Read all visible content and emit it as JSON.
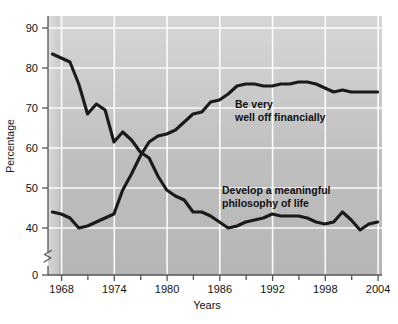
{
  "chart_data": {
    "type": "line",
    "title": "",
    "xlabel": "Years",
    "ylabel": "Percentage",
    "xlim": [
      1966.5,
      2004.5
    ],
    "ylim": [
      36,
      93
    ],
    "y_axis_break": true,
    "y_break_label": "0",
    "grid": true,
    "legend_position": "inline-annotations",
    "xticks": [
      1968,
      1974,
      1980,
      1986,
      1992,
      1998,
      2004
    ],
    "xtick_labels": [
      "1968",
      "1974",
      "1980",
      "1986",
      "1992",
      "1998",
      "2004"
    ],
    "xminorticks": [
      1971,
      1977,
      1983,
      1989,
      1995,
      2001
    ],
    "yticks": [
      0,
      40,
      50,
      60,
      70,
      80,
      90
    ],
    "ytick_labels": [
      "0",
      "40",
      "50",
      "60",
      "70",
      "80",
      "90"
    ],
    "x": [
      1967,
      1968,
      1969,
      1970,
      1971,
      1972,
      1973,
      1974,
      1975,
      1976,
      1977,
      1978,
      1979,
      1980,
      1981,
      1982,
      1983,
      1984,
      1985,
      1986,
      1987,
      1988,
      1989,
      1990,
      1991,
      1992,
      1993,
      1994,
      1995,
      1996,
      1997,
      1998,
      1999,
      2000,
      2001,
      2002,
      2003,
      2004
    ],
    "series": [
      {
        "name": "Be very well off financially",
        "color": "#1a1a1a",
        "label_line1": "Be very",
        "label_line2": "well off financially",
        "values": [
          44.0,
          43.5,
          42.5,
          40.0,
          40.5,
          41.5,
          42.5,
          43.5,
          49.5,
          53.5,
          58.0,
          61.5,
          63.0,
          63.5,
          64.5,
          66.5,
          68.5,
          69.0,
          71.5,
          72.0,
          73.5,
          75.5,
          76.0,
          76.0,
          75.5,
          75.5,
          76.0,
          76.0,
          76.5,
          76.5,
          76.0,
          75.0,
          74.0,
          74.5,
          74.0,
          74.0,
          74.0,
          74.0
        ]
      },
      {
        "name": "Develop a meaningful philosophy of life",
        "color": "#1a1a1a",
        "label_line1": "Develop a meaningful",
        "label_line2": "philosophy of life",
        "values": [
          83.5,
          82.5,
          81.5,
          76.0,
          68.5,
          71.0,
          69.5,
          61.5,
          64.0,
          62.0,
          59.0,
          57.5,
          53.0,
          49.5,
          48.0,
          47.0,
          44.0,
          44.0,
          43.0,
          41.5,
          40.0,
          40.5,
          41.5,
          42.0,
          42.5,
          43.5,
          43.0,
          43.0,
          43.0,
          42.5,
          41.5,
          41.0,
          41.5,
          44.0,
          42.0,
          39.5,
          41.0,
          41.5
        ]
      }
    ],
    "colors": {
      "plot_background_top": "#d2d2d2",
      "plot_background_bottom": "#b9b9b9",
      "gridline": "#ffffff",
      "axis": "#555555",
      "line": "#1a1a1a",
      "text": "#111111",
      "page_background": "#ffffff"
    }
  }
}
